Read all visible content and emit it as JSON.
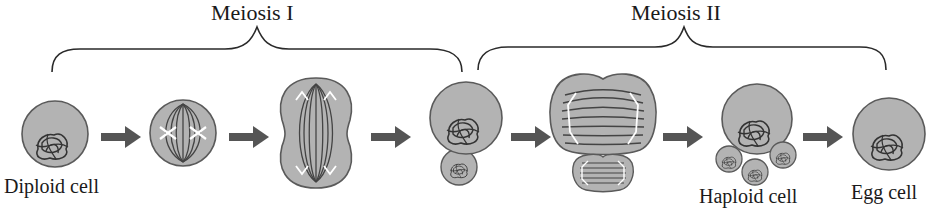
{
  "diagram": {
    "phases": [
      {
        "label": "Meiosis I",
        "label_x": 257,
        "brace": {
          "x1": 52,
          "x2": 462,
          "peak_x": 257
        }
      },
      {
        "label": "Meiosis II",
        "label_x": 684,
        "brace": {
          "x1": 478,
          "x2": 886,
          "peak_x": 684
        }
      }
    ],
    "stages": [
      {
        "id": "diploid",
        "label": "Diploid cell"
      },
      {
        "id": "metaphase-1",
        "label": ""
      },
      {
        "id": "anaphase-1",
        "label": ""
      },
      {
        "id": "secondary-oocyte",
        "label": ""
      },
      {
        "id": "meiosis-2-division",
        "label": ""
      },
      {
        "id": "haploid",
        "label": "Haploid cell"
      },
      {
        "id": "egg",
        "label": "Egg cell"
      }
    ],
    "colors": {
      "cell_fill": "#b3b3b3",
      "cell_stroke": "#5a5a5a",
      "chromatin": "#333333",
      "spindle_highlight": "#ffffff",
      "arrow": "#555555",
      "brace": "#2a2a2a",
      "text": "#1a1a1a"
    }
  }
}
